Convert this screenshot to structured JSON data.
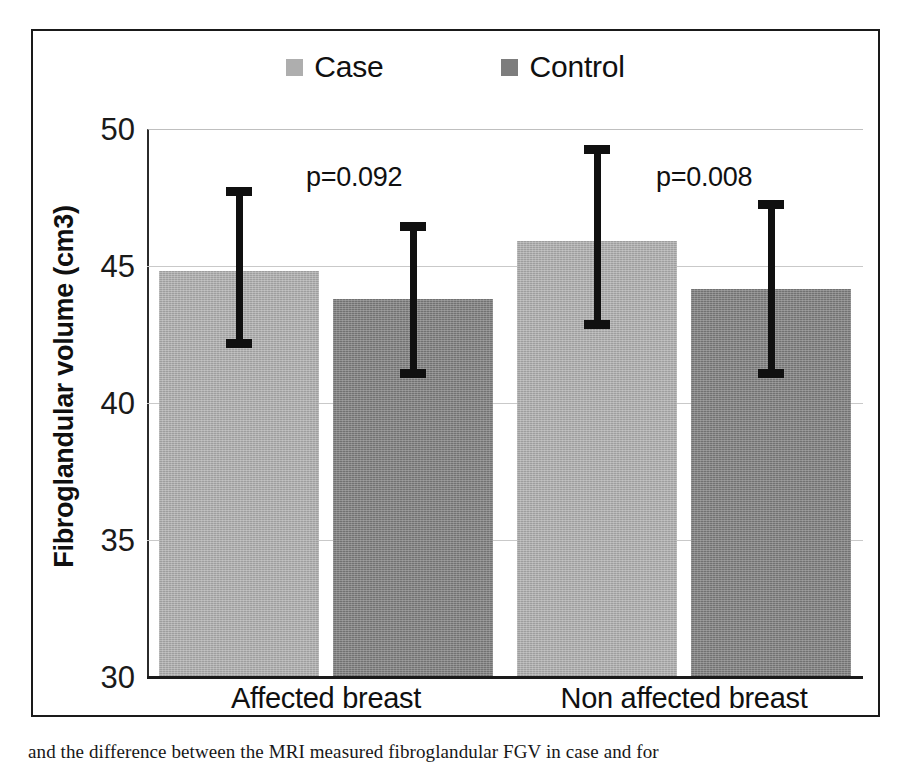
{
  "chart_data": {
    "type": "bar",
    "title": "",
    "xlabel": "",
    "ylabel": "Fibroglandular volume (cm3)",
    "categories": [
      "Affected breast",
      "Non affected breast"
    ],
    "ylim": [
      30,
      50
    ],
    "yticks": [
      30,
      35,
      40,
      45,
      50
    ],
    "ytick_labels": [
      "30",
      "35",
      "40",
      "45",
      "50"
    ],
    "grid": true,
    "legend_position": "top-center",
    "series": [
      {
        "name": "Case",
        "color": "#aeaeae",
        "values": [
          44.8,
          45.9
        ],
        "error_low": [
          42.0,
          42.7
        ],
        "error_high": [
          47.9,
          49.4
        ]
      },
      {
        "name": "Control",
        "color": "#7d7d7d",
        "values": [
          43.8,
          44.15
        ],
        "error_low": [
          40.9,
          40.9
        ],
        "error_high": [
          46.6,
          47.4
        ]
      }
    ],
    "annotations": [
      {
        "text": "p=0.092",
        "group": "Affected breast"
      },
      {
        "text": "p=0.008",
        "group": "Non affected breast"
      }
    ]
  },
  "legend": {
    "entries": [
      {
        "label": "Case",
        "color": "#aeaeae"
      },
      {
        "label": "Control",
        "color": "#7d7d7d"
      }
    ]
  },
  "axes": {
    "y_title": "Fibroglandular volume (cm3)",
    "y_labels": [
      "50",
      "45",
      "40",
      "35",
      "30"
    ],
    "x_labels": [
      "Affected breast",
      "Non affected breast"
    ]
  },
  "annotations": {
    "p_left": "p=0.092",
    "p_right": "p=0.008"
  },
  "caption": {
    "text": "and the difference between the MRI measured fibroglandular FGV in case and for"
  }
}
